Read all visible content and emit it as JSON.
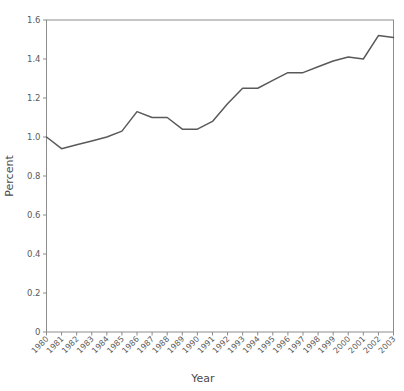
{
  "chart_data": {
    "type": "line",
    "title": "",
    "xlabel": "Year",
    "ylabel": "Percent",
    "grid": false,
    "legend": false,
    "legend_position": "none",
    "line_color": "#595959",
    "categories": [
      "1980",
      "1981",
      "1982",
      "1983",
      "1984",
      "1985",
      "1986",
      "1987",
      "1988",
      "1989",
      "1990",
      "1991",
      "1992",
      "1993",
      "1994",
      "1995",
      "1996",
      "1997",
      "1998",
      "1999",
      "2000",
      "2001",
      "2002",
      "2003"
    ],
    "values": [
      1.0,
      0.94,
      0.96,
      0.98,
      1.0,
      1.03,
      1.13,
      1.1,
      1.1,
      1.04,
      1.04,
      1.08,
      1.17,
      1.25,
      1.25,
      1.29,
      1.33,
      1.33,
      1.36,
      1.39,
      1.41,
      1.4,
      1.52,
      1.51
    ],
    "x": [
      "1980",
      "1981",
      "1982",
      "1983",
      "1984",
      "1985",
      "1986",
      "1987",
      "1988",
      "1989",
      "1990",
      "1991",
      "1992",
      "1993",
      "1994",
      "1995",
      "1996",
      "1997",
      "1998",
      "1999",
      "2000",
      "2001",
      "2002",
      "2003"
    ],
    "xlim": [
      "1980",
      "2003"
    ],
    "ylim": [
      0,
      1.6
    ],
    "ytick_labels": [
      "0",
      "0.2",
      "0.4",
      "0.6",
      "0.8",
      "1.0",
      "1.2",
      "1.4",
      "1.6"
    ],
    "ytick_values": [
      0,
      0.2,
      0.4,
      0.6,
      0.8,
      1.0,
      1.2,
      1.4,
      1.6
    ],
    "xtick_labels": [
      "1980",
      "1981",
      "1982",
      "1983",
      "1984",
      "1985",
      "1986",
      "1987",
      "1988",
      "1989",
      "1990",
      "1991",
      "1992",
      "1993",
      "1994",
      "1995",
      "1996",
      "1997",
      "1998",
      "1999",
      "2000",
      "2001",
      "2002",
      "2003"
    ],
    "annotations": []
  },
  "axes": {
    "y_label": "Percent",
    "x_label": "Year"
  }
}
